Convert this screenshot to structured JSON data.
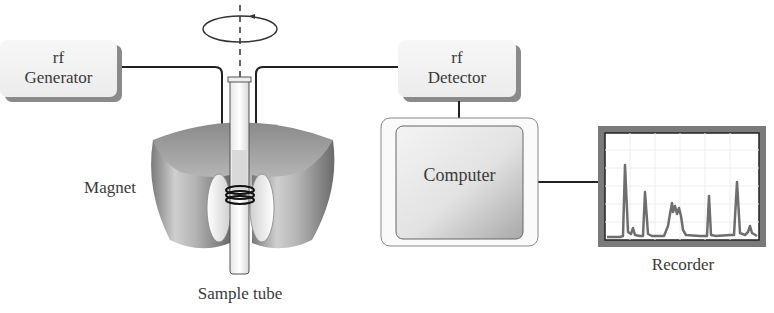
{
  "diagram": {
    "components": {
      "rf_generator": {
        "line1": "rf",
        "line2": "Generator"
      },
      "rf_detector": {
        "line1": "rf",
        "line2": "Detector"
      },
      "computer": {
        "label": "Computer"
      },
      "recorder": {
        "label": "Recorder"
      },
      "magnet": {
        "label": "Magnet"
      },
      "sample_tube": {
        "label": "Sample tube"
      }
    },
    "connections": [
      {
        "from": "rf Generator",
        "to": "coil"
      },
      {
        "from": "coil",
        "to": "rf Detector"
      },
      {
        "from": "rf Detector",
        "to": "Computer"
      },
      {
        "from": "Computer",
        "to": "Recorder"
      }
    ],
    "rotation_indicator": "spinning sample arrow around vertical axis",
    "colors": {
      "box_fill": "#f2f2f2",
      "box_shadow": "#8a8a8a",
      "magnet_dark": "#6e6e6e",
      "magnet_light": "#e6e6e6",
      "line": "#222222",
      "recorder_frame": "#777777",
      "spectrum": "#707070"
    }
  }
}
